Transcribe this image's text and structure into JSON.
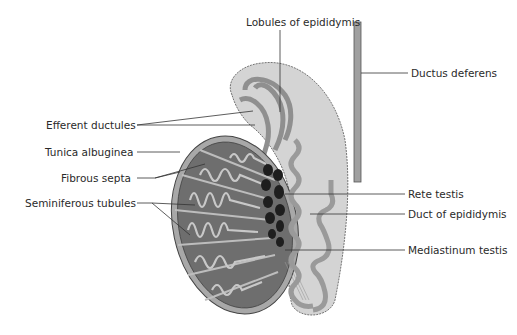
{
  "diagram": {
    "colors": {
      "background": "#ffffff",
      "testis_outer": "#a8a8a8",
      "tunica": "#bdbdbd",
      "lobule_fill": "#6e6e6e",
      "tubule": "#c8c8c8",
      "rete": "#1e1e1e",
      "epididymis": "#cfcfcf",
      "duct": "#9a9a9a",
      "leader_line": "#333333",
      "text": "#2a2a2a"
    },
    "labels": {
      "lobules_of_epididymis": "Lobules of epididymis",
      "ductus_deferens": "Ductus deferens",
      "efferent_ductules": "Efferent ductules",
      "tunica_albuginea": "Tunica albuginea",
      "fibrous_septa": "Fibrous septa",
      "seminiferous_tubules": "Seminiferous tubules",
      "rete_testis": "Rete testis",
      "duct_of_epididymis": "Duct of epididymis",
      "mediastinum_testis": "Mediastinum testis"
    }
  }
}
